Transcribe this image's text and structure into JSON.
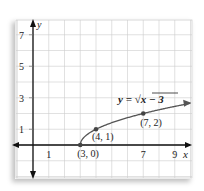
{
  "chart_data": {
    "type": "line",
    "title": "",
    "equation_label": "y = √x − 3",
    "equation_parts": {
      "lhs": "y =",
      "radical": "√",
      "radicand": "x − 3"
    },
    "xlabel": "x",
    "ylabel": "y",
    "xlim": [
      -1,
      10
    ],
    "ylim": [
      -2,
      8
    ],
    "x_ticks": [
      "1",
      "7",
      "9"
    ],
    "x_tick_values": [
      1,
      7,
      9
    ],
    "y_ticks": [
      "1",
      "3",
      "5",
      "7"
    ],
    "y_tick_values": [
      1,
      3,
      5,
      7
    ],
    "grid": true,
    "series": [
      {
        "name": "y = √(x − 3)",
        "function": "sqrt(x-3)",
        "x_start": 3,
        "x_end": 10,
        "color": "#555555"
      }
    ],
    "points": [
      {
        "label": "(3, 0)",
        "x": 3,
        "y": 0
      },
      {
        "label": "(4, 1)",
        "x": 4,
        "y": 1
      },
      {
        "label": "(7, 2)",
        "x": 7,
        "y": 2
      }
    ]
  },
  "colors": {
    "grid": "#cccccc",
    "axis": "#111111",
    "curve": "#555555",
    "point": "#444444"
  }
}
